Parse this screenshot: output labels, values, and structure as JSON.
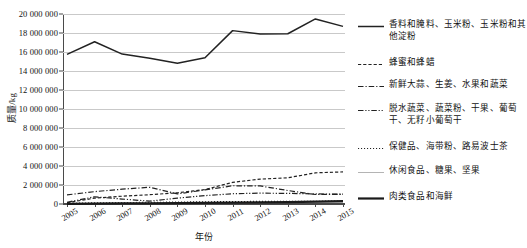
{
  "page": {
    "cropped_header_text": " "
  },
  "chart_data": {
    "type": "line",
    "title": "",
    "xlabel": "年份",
    "ylabel": "质量/kg",
    "x": [
      2005,
      2006,
      2007,
      2008,
      2009,
      2010,
      2011,
      2012,
      2013,
      2014,
      2015
    ],
    "categories": [
      "2005",
      "2006",
      "2007",
      "2008",
      "2009",
      "2010",
      "2011",
      "2012",
      "2013",
      "2014",
      "2015"
    ],
    "xlim": [
      2005,
      2015
    ],
    "ylim": [
      0,
      20000000
    ],
    "ytick_values": [
      0,
      2000000,
      4000000,
      6000000,
      8000000,
      10000000,
      12000000,
      14000000,
      16000000,
      18000000,
      20000000
    ],
    "ytick_labels": [
      "0",
      "2 000 000",
      "4 000 000",
      "6 000 000",
      "8 000 000",
      "10 000 000",
      "12 000 000",
      "14 000 000",
      "16 000 000",
      "18 000 000",
      "20 000 000"
    ],
    "grid": true,
    "legend_position": "right",
    "series": [
      {
        "name": "香料和腌料、玉米粉、玉米粉和其他淀粉",
        "style": "solid",
        "width": 1.5,
        "color": "#222222",
        "values": [
          15750000,
          17080000,
          15780000,
          15350000,
          14820000,
          15400000,
          18250000,
          17900000,
          17920000,
          19480000,
          18700000
        ]
      },
      {
        "name": "蜂蜜和蜂蜡",
        "style": "dashed",
        "width": 1.2,
        "color": "#222222",
        "values": [
          130000,
          620000,
          820000,
          980000,
          1180000,
          1520000,
          2280000,
          2620000,
          2760000,
          3280000,
          3380000
        ]
      },
      {
        "name": "新鲜大蒜、生姜、水果和蔬菜",
        "style": "dashdot",
        "width": 1.2,
        "color": "#222222",
        "values": [
          960000,
          1300000,
          1560000,
          1760000,
          1060000,
          1480000,
          1920000,
          1900000,
          1420000,
          1000000,
          1020000
        ]
      },
      {
        "name": "脱水蔬菜、蔬菜粉、干果、葡萄干、无籽小葡萄干",
        "style": "dashdotdot",
        "width": 1.2,
        "color": "#222222",
        "values": [
          180000,
          760000,
          520000,
          300000,
          620000,
          880000,
          1080000,
          1140000,
          1120000,
          1060000,
          1040000
        ]
      },
      {
        "name": "保健品、海带粉、路易波士茶",
        "style": "dotted",
        "width": 1.2,
        "color": "#222222",
        "values": [
          60000,
          120000,
          150000,
          170000,
          200000,
          230000,
          260000,
          270000,
          280000,
          290000,
          300000
        ]
      },
      {
        "name": "休闲食品、糖果、坚果",
        "style": "solid",
        "width": 1.0,
        "color": "#b4b4b4",
        "values": [
          30000,
          60000,
          80000,
          90000,
          110000,
          130000,
          150000,
          160000,
          170000,
          180000,
          190000
        ]
      },
      {
        "name": "肉类食品和海鲜",
        "style": "solid",
        "width": 2.2,
        "color": "#1a1a1a",
        "values": [
          20000,
          40000,
          60000,
          70000,
          90000,
          110000,
          150000,
          170000,
          200000,
          240000,
          300000
        ]
      }
    ]
  }
}
